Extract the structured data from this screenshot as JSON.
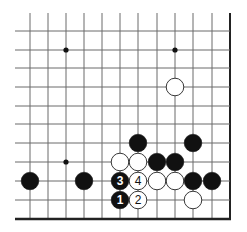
{
  "diagram": {
    "type": "go-board-fragment",
    "grid": {
      "columns_x": [
        30,
        48,
        66,
        84,
        102,
        120,
        138,
        157,
        175,
        193,
        212,
        230
      ],
      "rows_y": [
        31,
        50,
        68,
        87,
        106,
        124,
        143,
        162,
        181,
        200,
        219
      ],
      "open_left_x": 15,
      "open_top_y": 13,
      "edges": [
        "right",
        "bottom"
      ],
      "line_color": "#6a6a6a",
      "edge_color": "#222222"
    },
    "star_points": [
      {
        "col": 2,
        "row": 1
      },
      {
        "col": 8,
        "row": 1
      },
      {
        "col": 2,
        "row": 7
      }
    ],
    "stones": [
      {
        "color": "white",
        "col": 8,
        "row": 3,
        "label": ""
      },
      {
        "color": "black",
        "col": 6,
        "row": 6,
        "label": ""
      },
      {
        "color": "black",
        "col": 9,
        "row": 6,
        "label": ""
      },
      {
        "color": "white",
        "col": 5,
        "row": 7,
        "label": ""
      },
      {
        "color": "white",
        "col": 6,
        "row": 7,
        "label": ""
      },
      {
        "color": "black",
        "col": 7,
        "row": 7,
        "label": ""
      },
      {
        "color": "black",
        "col": 8,
        "row": 7,
        "label": ""
      },
      {
        "color": "black",
        "col": 0,
        "row": 8,
        "label": ""
      },
      {
        "color": "black",
        "col": 3,
        "row": 8,
        "label": ""
      },
      {
        "color": "black",
        "col": 5,
        "row": 8,
        "label": "3"
      },
      {
        "color": "white",
        "col": 6,
        "row": 8,
        "label": "4"
      },
      {
        "color": "white",
        "col": 7,
        "row": 8,
        "label": ""
      },
      {
        "color": "white",
        "col": 8,
        "row": 8,
        "label": ""
      },
      {
        "color": "black",
        "col": 9,
        "row": 8,
        "label": ""
      },
      {
        "color": "black",
        "col": 10,
        "row": 8,
        "label": ""
      },
      {
        "color": "black",
        "col": 5,
        "row": 9,
        "label": "1"
      },
      {
        "color": "white",
        "col": 6,
        "row": 9,
        "label": "2"
      },
      {
        "color": "white",
        "col": 9,
        "row": 9,
        "label": ""
      }
    ],
    "colors": {
      "black_stone": "#111111",
      "white_stone": "#ffffff",
      "white_stone_outline": "#222222",
      "star_point": "#111111"
    }
  }
}
